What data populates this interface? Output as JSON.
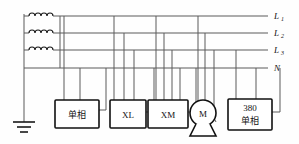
{
  "diagram": {
    "colors": {
      "wire": "#5a5a5a",
      "outline": "#111111",
      "background": "#ffffff"
    },
    "bus_labels": [
      {
        "name": "L1",
        "main": "L",
        "sub": "1"
      },
      {
        "name": "L2",
        "main": "L",
        "sub": "2"
      },
      {
        "name": "L3",
        "main": "L",
        "sub": "3"
      },
      {
        "name": "N",
        "main": "N",
        "sub": ""
      }
    ],
    "source": {
      "name": "transformer-windings",
      "coil_count": 3
    },
    "ground": {
      "name": "earth-ground",
      "bar_count": 3
    },
    "loads": [
      {
        "id": "single-phase-load",
        "line1": "单相",
        "line2": "",
        "taps": 2
      },
      {
        "id": "xl-load",
        "line1": "XL",
        "line2": "",
        "taps": 3
      },
      {
        "id": "xm-load",
        "line1": "XM",
        "line2": "",
        "taps": 4
      },
      {
        "id": "motor",
        "line1": "M",
        "line2": "",
        "taps": 3
      },
      {
        "id": "380-single-phase-load",
        "line1": "380",
        "line2": "单相",
        "taps": 2
      }
    ]
  }
}
